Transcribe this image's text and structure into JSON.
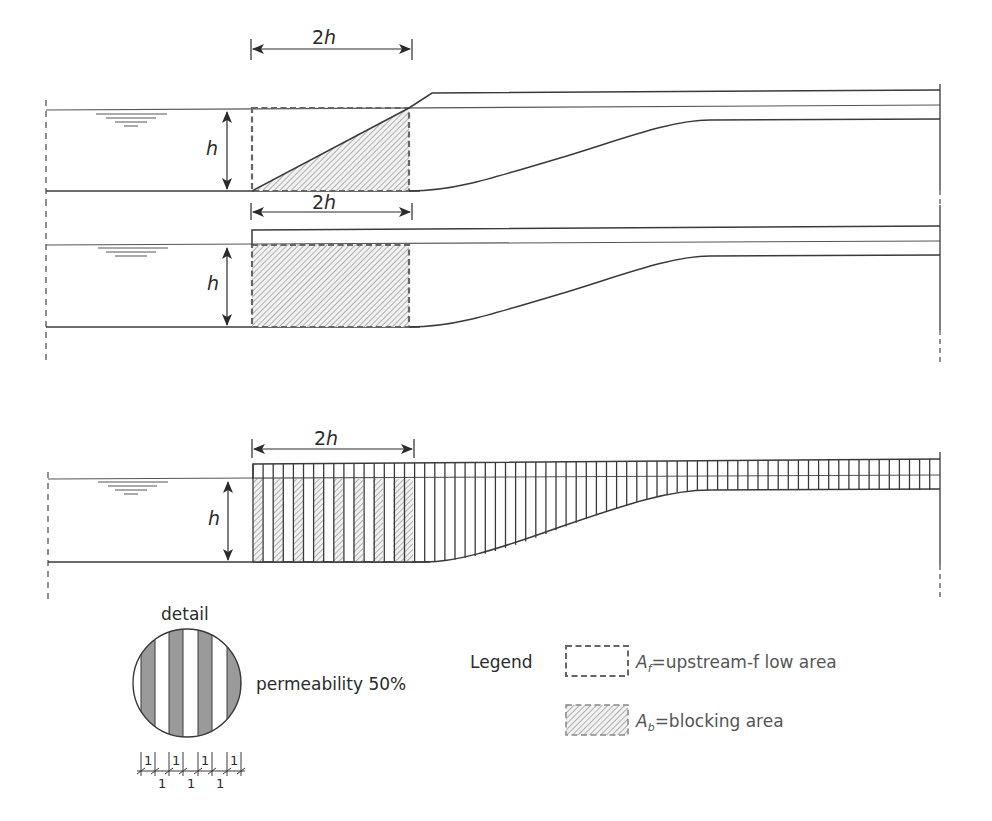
{
  "figure": {
    "panels": [
      {
        "id": "sloped-block",
        "description": "Triangular (sloped) blockage upstream",
        "dimension_width_label": "2h",
        "dimension_height_label": "h"
      },
      {
        "id": "rectangular-block",
        "description": "Rectangular full blockage",
        "dimension_width_label": "2h",
        "dimension_height_label": "h"
      },
      {
        "id": "permeable-block",
        "description": "Permeable slatted blockage",
        "dimension_width_label": "2h",
        "dimension_height_label": "h"
      }
    ],
    "detail": {
      "title": "detail",
      "permeability_label": "permeability 50%",
      "scale_top_labels": [
        "1",
        "1",
        "1",
        "1"
      ],
      "scale_bottom_labels": [
        "1",
        "1",
        "1"
      ]
    },
    "legend": {
      "title": "Legend",
      "items": [
        {
          "symbol": "A",
          "subscript": "f",
          "text": "=upstream-f low area",
          "style": "dashed-empty"
        },
        {
          "symbol": "A",
          "subscript": "b",
          "text": "=blocking area",
          "style": "dashed-hatched"
        }
      ]
    },
    "colors": {
      "line": "#3a3a3a",
      "dashed": "#666666",
      "hatch": "#8a8a8a",
      "detail_fill": "#9a9a9a"
    }
  }
}
